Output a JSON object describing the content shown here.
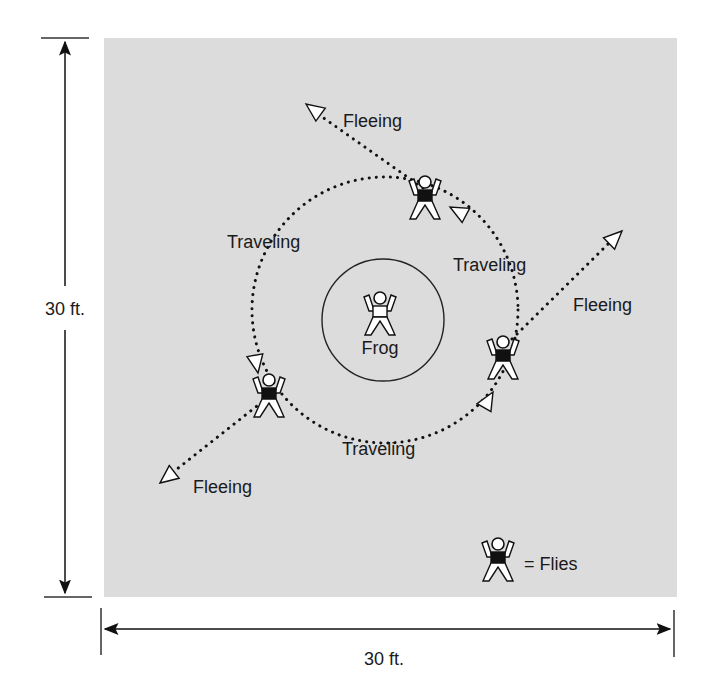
{
  "diagram": {
    "field_color": "#dcdcdc",
    "dimensions": {
      "vertical_label": "30 ft.",
      "horizontal_label": "30 ft."
    },
    "center": {
      "label": "Frog",
      "role": "frog"
    },
    "paths": {
      "traveling_labels": [
        "Traveling",
        "Traveling",
        "Traveling"
      ],
      "fleeing_labels": [
        "Fleeing",
        "Fleeing",
        "Fleeing"
      ]
    },
    "legend": {
      "text": "= Flies",
      "icon": "fly-figure-icon"
    }
  }
}
